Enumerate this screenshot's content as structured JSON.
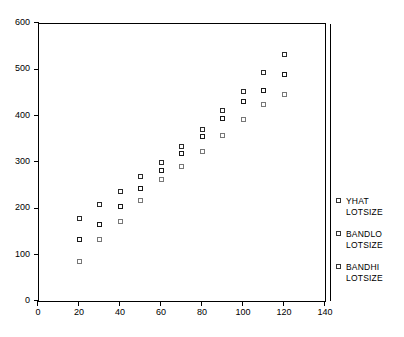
{
  "chart_data": {
    "type": "scatter",
    "title": "",
    "xlabel": "",
    "ylabel": "",
    "xlim": [
      0,
      140
    ],
    "ylim": [
      0,
      600
    ],
    "xticks": [
      0,
      20,
      40,
      60,
      80,
      100,
      120,
      140
    ],
    "yticks": [
      0,
      100,
      200,
      300,
      400,
      500,
      600
    ],
    "grid": false,
    "legend_position": "right",
    "x": [
      20,
      30,
      40,
      50,
      60,
      70,
      80,
      90,
      100,
      110,
      120
    ],
    "series": [
      {
        "name": "BANDHI LOTSIZE",
        "marker": "open-square",
        "values": [
          178,
          208,
          237,
          268,
          300,
          333,
          371,
          411,
          453,
          493,
          533
        ]
      },
      {
        "name": "YHAT LOTSIZE",
        "marker": "open-square",
        "values": [
          133,
          166,
          204,
          243,
          281,
          319,
          356,
          393,
          430,
          455,
          488
        ]
      },
      {
        "name": "BANDLO LOTSIZE",
        "marker": "open-square",
        "values": [
          85,
          133,
          171,
          216,
          262,
          291,
          323,
          358,
          392,
          425,
          445
        ]
      }
    ]
  },
  "legend": {
    "entries": [
      {
        "name": "YHAT",
        "sub": "LOTSIZE"
      },
      {
        "name": "BANDLO",
        "sub": "LOTSIZE"
      },
      {
        "name": "BANDHI",
        "sub": "LOTSIZE"
      }
    ]
  },
  "colors": {
    "axis": "#000000",
    "yhat": "#1a1a1a",
    "bandhi": "#2b2b2b",
    "bandlo": "#777777",
    "background": "#ffffff"
  }
}
